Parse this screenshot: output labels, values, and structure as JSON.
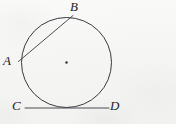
{
  "figure": {
    "kind": "geometry-diagram",
    "background_color": "#f5f5f3",
    "stroke_color": "#3a3a42",
    "label_color": "#24242a",
    "width": 176,
    "height": 124
  },
  "circle": {
    "name": "circle",
    "cx": 66.5,
    "cy": 62.5,
    "r": 45,
    "stroke_width": 1.0
  },
  "center_dot": {
    "name": "center-point",
    "cx": 66.5,
    "cy": 62.5,
    "r": 1.2
  },
  "chord": {
    "name": "chord-AB",
    "x1": 18.5,
    "y1": 61.5,
    "x2": 73.0,
    "y2": 15.5,
    "stroke_width": 0.9
  },
  "tangent": {
    "name": "tangent-CD",
    "x1": 25.0,
    "y1": 108.0,
    "x2": 109.0,
    "y2": 108.0,
    "stroke_width": 0.9
  },
  "labels": {
    "a": {
      "text": "A",
      "x": 3,
      "y": 54,
      "size": 13
    },
    "b": {
      "text": "B",
      "x": 70,
      "y": 0,
      "size": 13
    },
    "c": {
      "text": "C",
      "x": 12,
      "y": 99,
      "size": 13
    },
    "d": {
      "text": "D",
      "x": 110,
      "y": 99,
      "size": 13
    }
  }
}
